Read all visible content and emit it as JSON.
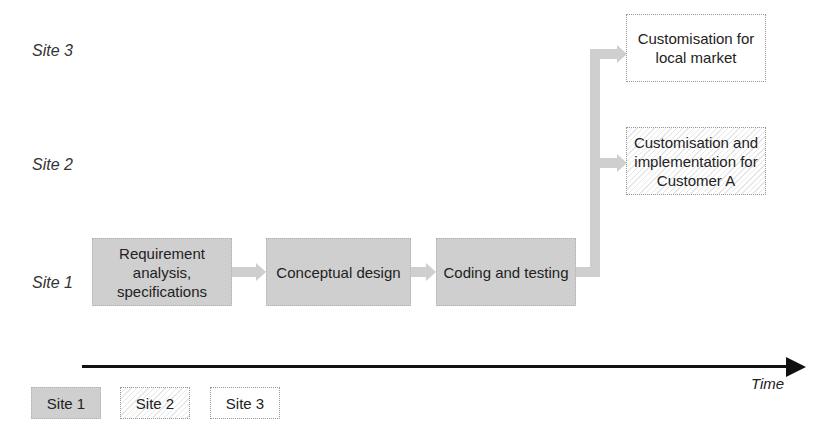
{
  "diagram": {
    "rows": [
      "Site 3",
      "Site 2",
      "Site 1"
    ],
    "boxes": [
      {
        "text": "Requirement analysis, specifications",
        "site": "Site 1"
      },
      {
        "text": "Conceptual design",
        "site": "Site 1"
      },
      {
        "text": "Coding and testing",
        "site": "Site 1"
      },
      {
        "text": "Customisation and implementation for Customer A",
        "site": "Site 2"
      },
      {
        "text": "Customisation for local market",
        "site": "Site 3"
      }
    ],
    "axis_label": "Time",
    "legend": [
      "Site 1",
      "Site 2",
      "Site 3"
    ],
    "colors": {
      "site1_fill": "#cfcfcf",
      "arrow": "#cfcfcf",
      "axis": "#111111"
    }
  }
}
